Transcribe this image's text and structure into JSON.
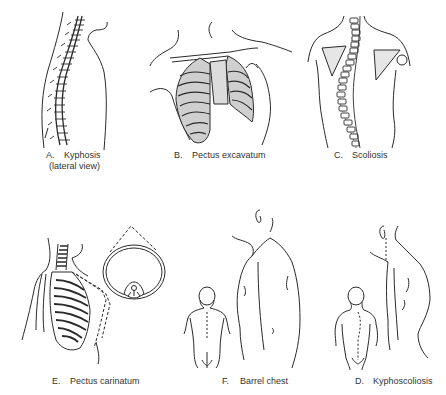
{
  "figure": {
    "panels": [
      {
        "id": "A",
        "letter": "A.",
        "title": "Kyphosis",
        "subtitle": "(lateral view)"
      },
      {
        "id": "B",
        "letter": "B.",
        "title": "Pectus excavatum"
      },
      {
        "id": "C",
        "letter": "C.",
        "title": "Scoliosis"
      },
      {
        "id": "E",
        "letter": "E.",
        "title": "Pectus carinatum"
      },
      {
        "id": "F",
        "letter": "F.",
        "title": "Barrel chest"
      },
      {
        "id": "D",
        "letter": "D.",
        "title": "Kyphoscoliosis"
      }
    ],
    "colors": {
      "line": "#2a2a2a",
      "shade": "#c8c8c8",
      "background": "#ffffff"
    }
  }
}
